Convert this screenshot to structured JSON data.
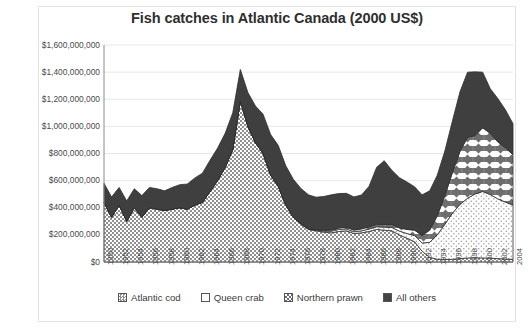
{
  "chart": {
    "title": "Fish catches in Atlantic Canada (2000 US$)",
    "legend_position": "bottom"
  },
  "legend": {
    "items": [
      {
        "label": "Atlantic cod",
        "pattern": "fine-checker",
        "color": "#9a9a9a"
      },
      {
        "label": "Queen crab",
        "pattern": "fine-dot",
        "color": "#ffffff"
      },
      {
        "label": "Northern prawn",
        "pattern": "bold-checker",
        "color": "#777777"
      },
      {
        "label": "All others",
        "pattern": "solid-dark",
        "color": "#444444"
      }
    ]
  },
  "axes": {
    "y_ticks": [
      "$0",
      "$200,000,000",
      "$400,000,000",
      "$600,000,000",
      "$800,000,000",
      "$1,000,000,000",
      "$1,200,000,000",
      "$1,400,000,000",
      "$1,600,000,000"
    ],
    "x_ticks": [
      "1950",
      "1952",
      "1954",
      "1956",
      "1958",
      "1960",
      "1962",
      "1964",
      "1966",
      "1968",
      "1970",
      "1972",
      "1974",
      "1976",
      "1978",
      "1980",
      "1982",
      "1984",
      "1986",
      "1988",
      "1990",
      "1992",
      "1994",
      "1996",
      "1998",
      "2000",
      "2002",
      "2004"
    ]
  },
  "chart_data": {
    "type": "area",
    "stacked": true,
    "title": "Fish catches in Atlantic Canada (2000 US$)",
    "xlabel": "",
    "ylabel": "",
    "ylim": [
      0,
      1600000000
    ],
    "y_tick_step": 200000000,
    "grid": true,
    "units": "2000 US$",
    "x": [
      1950,
      1951,
      1952,
      1953,
      1954,
      1955,
      1956,
      1957,
      1958,
      1959,
      1960,
      1961,
      1962,
      1963,
      1964,
      1965,
      1966,
      1967,
      1968,
      1969,
      1970,
      1971,
      1972,
      1973,
      1974,
      1975,
      1976,
      1977,
      1978,
      1979,
      1980,
      1981,
      1982,
      1983,
      1984,
      1985,
      1986,
      1987,
      1988,
      1989,
      1990,
      1991,
      1992,
      1993,
      1994,
      1995,
      1996,
      1997,
      1998,
      1999,
      2000,
      2001,
      2002,
      2003,
      2004
    ],
    "series": [
      {
        "name": "Atlantic cod",
        "pattern": "fine-checker",
        "values": [
          440000000,
          330000000,
          420000000,
          300000000,
          400000000,
          330000000,
          400000000,
          390000000,
          380000000,
          390000000,
          400000000,
          390000000,
          420000000,
          440000000,
          520000000,
          600000000,
          700000000,
          830000000,
          1190000000,
          1000000000,
          880000000,
          800000000,
          640000000,
          560000000,
          420000000,
          330000000,
          280000000,
          240000000,
          230000000,
          220000000,
          215000000,
          225000000,
          230000000,
          210000000,
          215000000,
          225000000,
          240000000,
          235000000,
          230000000,
          200000000,
          175000000,
          150000000,
          80000000,
          35000000,
          20000000,
          18000000,
          20000000,
          25000000,
          30000000,
          32000000,
          30000000,
          28000000,
          25000000,
          22000000,
          20000000
        ]
      },
      {
        "name": "Queen crab",
        "pattern": "fine-dot",
        "values": [
          0,
          0,
          0,
          0,
          0,
          0,
          0,
          0,
          0,
          0,
          0,
          0,
          0,
          0,
          0,
          0,
          0,
          0,
          0,
          0,
          0,
          0,
          0,
          0,
          0,
          0,
          2000000,
          3000000,
          5000000,
          8000000,
          12000000,
          15000000,
          14000000,
          13000000,
          15000000,
          18000000,
          20000000,
          22000000,
          25000000,
          28000000,
          35000000,
          45000000,
          60000000,
          110000000,
          180000000,
          260000000,
          340000000,
          400000000,
          440000000,
          470000000,
          490000000,
          470000000,
          440000000,
          420000000,
          400000000
        ]
      },
      {
        "name": "Northern prawn",
        "pattern": "bold-checker",
        "values": [
          0,
          0,
          0,
          0,
          0,
          0,
          0,
          0,
          0,
          0,
          0,
          0,
          0,
          0,
          0,
          0,
          0,
          0,
          0,
          0,
          0,
          0,
          0,
          0,
          0,
          0,
          0,
          2000000,
          3000000,
          5000000,
          8000000,
          10000000,
          12000000,
          12000000,
          14000000,
          16000000,
          18000000,
          20000000,
          22000000,
          24000000,
          30000000,
          40000000,
          55000000,
          90000000,
          140000000,
          210000000,
          300000000,
          390000000,
          450000000,
          430000000,
          470000000,
          450000000,
          420000000,
          400000000,
          370000000
        ]
      },
      {
        "name": "All others",
        "pattern": "solid-dark",
        "values": [
          140000000,
          150000000,
          130000000,
          150000000,
          140000000,
          160000000,
          150000000,
          150000000,
          145000000,
          160000000,
          170000000,
          185000000,
          200000000,
          215000000,
          230000000,
          240000000,
          250000000,
          270000000,
          230000000,
          250000000,
          270000000,
          290000000,
          300000000,
          300000000,
          290000000,
          280000000,
          260000000,
          250000000,
          240000000,
          250000000,
          260000000,
          255000000,
          250000000,
          245000000,
          250000000,
          300000000,
          420000000,
          470000000,
          400000000,
          370000000,
          350000000,
          320000000,
          300000000,
          290000000,
          300000000,
          330000000,
          380000000,
          440000000,
          480000000,
          470000000,
          410000000,
          330000000,
          320000000,
          280000000,
          230000000
        ]
      }
    ],
    "annotations": [
      {
        "text": "Peak total catch value 1968, about $1.42 billion",
        "x": 1968,
        "y": 1420000000
      },
      {
        "text": "Cod stock collapse in the early 1990s",
        "x": 1992,
        "y": 80000000
      },
      {
        "text": "Second peak 2000, about $1.40 billion, driven by crab and prawn",
        "x": 2000,
        "y": 1400000000
      }
    ]
  }
}
